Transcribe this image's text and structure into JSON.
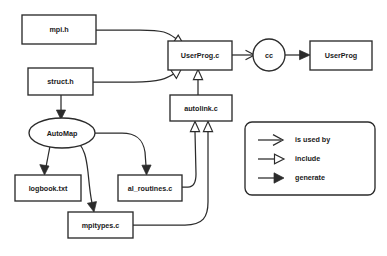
{
  "diagram": {
    "background_color": "#ffffff",
    "line_color": "#2b2b2b",
    "text_color": "#1a1a1a",
    "nodes": [
      {
        "id": "mpi_h",
        "label": "mpi.h",
        "shape": "rect"
      },
      {
        "id": "struct_h",
        "label": "struct.h",
        "shape": "rect"
      },
      {
        "id": "userprog_c",
        "label": "UserProg.c",
        "shape": "rect"
      },
      {
        "id": "cc",
        "label": "cc",
        "shape": "circle"
      },
      {
        "id": "userprog",
        "label": "UserProg",
        "shape": "rect"
      },
      {
        "id": "autolink_c",
        "label": "autolink.c",
        "shape": "rect"
      },
      {
        "id": "automap",
        "label": "AutoMap",
        "shape": "ellipse"
      },
      {
        "id": "logbook_txt",
        "label": "logbook.txt",
        "shape": "rect"
      },
      {
        "id": "al_routines_c",
        "label": "al_routines.c",
        "shape": "rect"
      },
      {
        "id": "mpitypes_c",
        "label": "mpitypes.c",
        "shape": "rect"
      }
    ],
    "edges": [
      {
        "from": "mpi_h",
        "to": "userprog_c",
        "kind": "include"
      },
      {
        "from": "struct_h",
        "to": "userprog_c",
        "kind": "include"
      },
      {
        "from": "autolink_c",
        "to": "userprog_c",
        "kind": "include"
      },
      {
        "from": "userprog_c",
        "to": "cc",
        "kind": "is used by"
      },
      {
        "from": "cc",
        "to": "userprog",
        "kind": "generate"
      },
      {
        "from": "struct_h",
        "to": "automap",
        "kind": "generate"
      },
      {
        "from": "automap",
        "to": "logbook_txt",
        "kind": "generate"
      },
      {
        "from": "automap",
        "to": "mpitypes_c",
        "kind": "generate"
      },
      {
        "from": "automap",
        "to": "al_routines_c",
        "kind": "generate"
      },
      {
        "from": "al_routines_c",
        "to": "autolink_c",
        "kind": "include"
      },
      {
        "from": "mpitypes_c",
        "to": "autolink_c",
        "kind": "include"
      }
    ]
  },
  "legend": {
    "items": [
      {
        "key": "is-used-by",
        "label": "is used by",
        "arrowhead": "open"
      },
      {
        "key": "include",
        "label": "include",
        "arrowhead": "hollow-triangle"
      },
      {
        "key": "generate",
        "label": "generate",
        "arrowhead": "solid-triangle"
      }
    ]
  }
}
